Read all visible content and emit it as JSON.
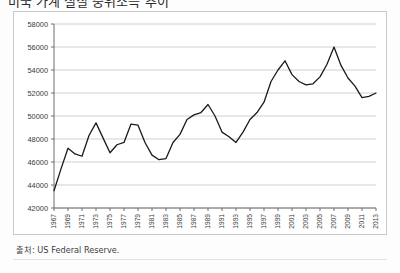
{
  "title": {
    "text": "미국 가계 실질 중위소득 추이",
    "clipped": true
  },
  "source": {
    "label": "출처: US Federal Reserve."
  },
  "colors": {
    "line": "#1a1a1a",
    "grid": "#d0d0d0",
    "axis": "#6f6f6f",
    "frame": "#c9c9c9",
    "background": "#ffffff",
    "text": "#3a3a3a"
  },
  "chart_data": {
    "type": "line",
    "title": "미국 가계 실질 중위소득 추이",
    "xlabel": "",
    "ylabel": "",
    "ylim": [
      42000,
      58000
    ],
    "ytick_values": [
      42000,
      44000,
      46000,
      48000,
      50000,
      52000,
      54000,
      56000,
      58000
    ],
    "ytick_labels": [
      "42000",
      "44000",
      "46000",
      "48000",
      "50000",
      "52000",
      "54000",
      "56000",
      "58000"
    ],
    "xlim": [
      1967,
      2013
    ],
    "xtick_values": [
      1967,
      1969,
      1971,
      1973,
      1975,
      1977,
      1979,
      1981,
      1983,
      1985,
      1987,
      1989,
      1991,
      1993,
      1995,
      1997,
      1999,
      2001,
      2003,
      2005,
      2007,
      2009,
      2011,
      2013
    ],
    "xtick_labels": [
      "1967",
      "1969",
      "1971",
      "1973",
      "1975",
      "1977",
      "1979",
      "1981",
      "1983",
      "1985",
      "1987",
      "1989",
      "1991",
      "1993",
      "1995",
      "1997",
      "1999",
      "2001",
      "2003",
      "2005",
      "2007",
      "2009",
      "2011",
      "2013"
    ],
    "xtick_rotation": 90,
    "grid": "horizontal",
    "legend": "none",
    "x": [
      1967,
      1968,
      1969,
      1970,
      1971,
      1972,
      1973,
      1974,
      1975,
      1976,
      1977,
      1978,
      1979,
      1980,
      1981,
      1982,
      1983,
      1984,
      1985,
      1986,
      1987,
      1988,
      1989,
      1990,
      1991,
      1992,
      1993,
      1994,
      1995,
      1996,
      1997,
      1998,
      1999,
      2000,
      2001,
      2002,
      2003,
      2004,
      2005,
      2006,
      2007,
      2008,
      2009,
      2010,
      2011,
      2012,
      2013
    ],
    "values": [
      43500,
      45400,
      47200,
      46700,
      46500,
      48300,
      49400,
      48100,
      46800,
      47500,
      47700,
      49300,
      49200,
      47700,
      46600,
      46200,
      46300,
      47700,
      48400,
      49700,
      50100,
      50300,
      51000,
      50000,
      48600,
      48200,
      47700,
      48600,
      49700,
      50300,
      51200,
      53000,
      54000,
      54800,
      53600,
      53000,
      52700,
      52800,
      53400,
      54500,
      56000,
      54400,
      53300,
      52600,
      51600,
      51700,
      52000
    ],
    "annotations": [
      {
        "text": "peak 1999-2000",
        "x": 2000,
        "y": 54800
      },
      {
        "text": "peak 2007",
        "x": 2007,
        "y": 56000
      }
    ]
  }
}
